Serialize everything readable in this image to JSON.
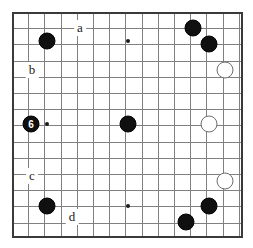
{
  "figure": {
    "kind": "go-board-diagram",
    "width": 253,
    "height": 248,
    "background_color": "#ffffff",
    "grid_line_color": "#808080",
    "border_color": "#3a3a3a",
    "black_stone_color": "#101010",
    "white_stone_color": "#ffffff",
    "white_stone_edge_color": "#6e6e6e",
    "grid_spacing": 16.2,
    "columns": 15,
    "rows": 14,
    "stone_diameter": 17,
    "board_left": 12,
    "board_top": 12,
    "board_right": 241,
    "board_bottom": 236
  },
  "stones": [
    {
      "id": "stone-1",
      "color": "black",
      "x": 47,
      "y": 41,
      "label": ""
    },
    {
      "id": "stone-2",
      "color": "black",
      "x": 193,
      "y": 28,
      "label": ""
    },
    {
      "id": "stone-3",
      "color": "black",
      "x": 209,
      "y": 44,
      "label": ""
    },
    {
      "id": "stone-4",
      "color": "white",
      "x": 225,
      "y": 70,
      "label": ""
    },
    {
      "id": "stone-5",
      "color": "black",
      "x": 31,
      "y": 124,
      "label": "6"
    },
    {
      "id": "stone-6",
      "color": "black",
      "x": 128,
      "y": 124,
      "label": ""
    },
    {
      "id": "stone-7",
      "color": "white",
      "x": 209,
      "y": 124,
      "label": ""
    },
    {
      "id": "stone-8",
      "color": "white",
      "x": 225,
      "y": 181,
      "label": ""
    },
    {
      "id": "stone-9",
      "color": "black",
      "x": 47,
      "y": 206,
      "label": ""
    },
    {
      "id": "stone-10",
      "color": "black",
      "x": 209,
      "y": 206,
      "label": ""
    },
    {
      "id": "stone-11",
      "color": "black",
      "x": 186,
      "y": 222,
      "label": ""
    }
  ],
  "star_points": [
    {
      "id": "star-top-center",
      "x": 128,
      "y": 41
    },
    {
      "id": "star-bottom-center",
      "x": 128,
      "y": 206
    }
  ],
  "marker_dots": [
    {
      "id": "dot-left-center",
      "x": 47,
      "y": 124
    }
  ],
  "point_labels": [
    {
      "id": "label-a",
      "text": "a",
      "x": 80,
      "y": 28
    },
    {
      "id": "label-b",
      "text": "b",
      "x": 32,
      "y": 70
    },
    {
      "id": "label-c",
      "text": "c",
      "x": 32,
      "y": 176
    },
    {
      "id": "label-d",
      "text": "d",
      "x": 72,
      "y": 217
    }
  ]
}
